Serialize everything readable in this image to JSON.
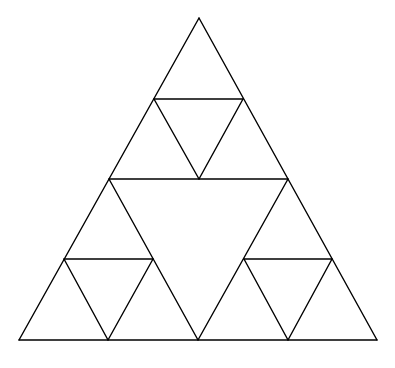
{
  "diagram": {
    "type": "sierpinski-triangle",
    "depth": 2,
    "stroke_color": "#000000",
    "background_color": "#ffffff",
    "vertices": {
      "apex": [
        199,
        18
      ],
      "bottom_left": [
        19,
        340
      ],
      "bottom_right": [
        377,
        340
      ]
    },
    "lines": [
      {
        "id": "outer-left",
        "x1": 199,
        "y1": 18,
        "x2": 19,
        "y2": 340
      },
      {
        "id": "outer-right",
        "x1": 199,
        "y1": 18,
        "x2": 377,
        "y2": 340
      },
      {
        "id": "outer-base",
        "x1": 19,
        "y1": 340,
        "x2": 377,
        "y2": 340
      },
      {
        "id": "mid-horizontal",
        "x1": 109,
        "y1": 179,
        "x2": 288,
        "y2": 179
      },
      {
        "id": "mid-left-diag",
        "x1": 109,
        "y1": 179,
        "x2": 198,
        "y2": 340
      },
      {
        "id": "mid-right-diag",
        "x1": 288,
        "y1": 179,
        "x2": 198,
        "y2": 340
      },
      {
        "id": "top-sub-horizontal",
        "x1": 154,
        "y1": 99,
        "x2": 243,
        "y2": 99
      },
      {
        "id": "top-sub-left-diag",
        "x1": 154,
        "y1": 99,
        "x2": 199,
        "y2": 179
      },
      {
        "id": "top-sub-right-diag",
        "x1": 243,
        "y1": 99,
        "x2": 199,
        "y2": 179
      },
      {
        "id": "left-sub-horizontal",
        "x1": 64,
        "y1": 259,
        "x2": 153,
        "y2": 259
      },
      {
        "id": "left-sub-left-diag",
        "x1": 64,
        "y1": 259,
        "x2": 108,
        "y2": 340
      },
      {
        "id": "left-sub-right-diag",
        "x1": 153,
        "y1": 259,
        "x2": 108,
        "y2": 340
      },
      {
        "id": "right-sub-horizontal",
        "x1": 244,
        "y1": 259,
        "x2": 332,
        "y2": 259
      },
      {
        "id": "right-sub-left-diag",
        "x1": 244,
        "y1": 259,
        "x2": 288,
        "y2": 340
      },
      {
        "id": "right-sub-right-diag",
        "x1": 332,
        "y1": 259,
        "x2": 288,
        "y2": 340
      }
    ]
  }
}
